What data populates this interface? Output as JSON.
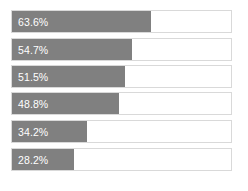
{
  "chart_data": {
    "type": "bar",
    "orientation": "horizontal",
    "title": "",
    "xlabel": "",
    "ylabel": "",
    "xlim": [
      0,
      100
    ],
    "grid": false,
    "legend": null,
    "categories": [
      "",
      "",
      "",
      "",
      "",
      ""
    ],
    "values": [
      63.6,
      54.7,
      51.5,
      48.8,
      34.2,
      28.2
    ],
    "data_labels": [
      "63.6%",
      "54.7%",
      "51.5%",
      "48.8%",
      "34.2%",
      "28.2%"
    ],
    "bar_color": "#808080",
    "track_color": "#ffffff",
    "track_border_color": "#d9d9d9",
    "label_color": "#ffffff"
  },
  "bars": [
    {
      "label": "63.6%",
      "value": 63.6
    },
    {
      "label": "54.7%",
      "value": 54.7
    },
    {
      "label": "51.5%",
      "value": 51.5
    },
    {
      "label": "48.8%",
      "value": 48.8
    },
    {
      "label": "34.2%",
      "value": 34.2
    },
    {
      "label": "28.2%",
      "value": 28.2
    }
  ]
}
